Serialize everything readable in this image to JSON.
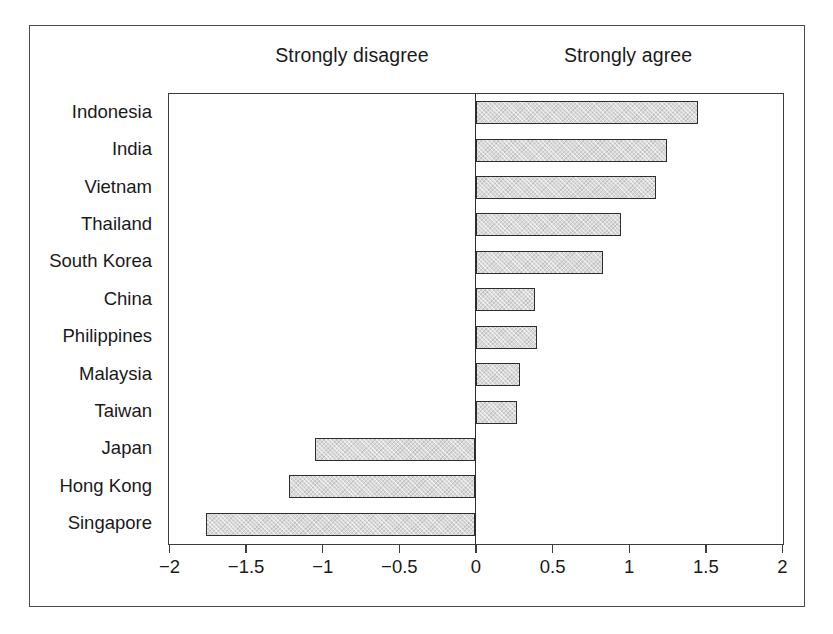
{
  "chart_data": {
    "type": "bar",
    "orientation": "horizontal",
    "title": "",
    "subtitle": "",
    "xlabel": "",
    "ylabel": "",
    "xlim": [
      -2,
      2
    ],
    "grid": false,
    "legend_position": "none",
    "annotations": [
      {
        "text": "Strongly disagree",
        "side": "left"
      },
      {
        "text": "Strongly agree",
        "side": "right"
      }
    ],
    "x_ticks": [
      -2,
      -1.5,
      -1,
      -0.5,
      0,
      0.5,
      1,
      1.5,
      2
    ],
    "x_tick_labels": [
      "−2",
      "−1.5",
      "−1",
      "−0.5",
      "0",
      "0.5",
      "1",
      "1.5",
      "2"
    ],
    "categories": [
      "Indonesia",
      "India",
      "Vietnam",
      "Thailand",
      "South Korea",
      "China",
      "Philippines",
      "Malaysia",
      "Taiwan",
      "Japan",
      "Hong Kong",
      "Singapore"
    ],
    "values": [
      1.45,
      1.25,
      1.18,
      0.95,
      0.83,
      0.39,
      0.4,
      0.29,
      0.27,
      -1.05,
      -1.22,
      -1.76
    ],
    "bar_fill_color": "#d9d9d9",
    "bar_edge_color": "#2e2e2e",
    "frame_color": "#4a4a4a",
    "background_color": "#ffffff"
  },
  "labels": {
    "negative_pole": "Strongly disagree",
    "positive_pole": "Strongly agree"
  }
}
